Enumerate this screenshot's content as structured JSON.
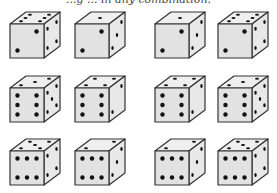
{
  "caption": "...g ... in any combination.",
  "colors": {
    "front_face": "#e2e2e2",
    "top_face": "#efefef",
    "right_face": "#e8e8e8",
    "outline": "#333333",
    "pip": "#111111"
  },
  "dice": [
    {
      "row": 1,
      "col": 1,
      "x": 8,
      "y": 10,
      "top": 6,
      "front": 2,
      "right": 4
    },
    {
      "row": 1,
      "col": 2,
      "x": 73,
      "y": 10,
      "top": 1,
      "front": 2,
      "right": 3
    },
    {
      "row": 1,
      "col": 3,
      "x": 153,
      "y": 10,
      "top": 1,
      "front": 2,
      "right": 3
    },
    {
      "row": 1,
      "col": 4,
      "x": 216,
      "y": 10,
      "top": 6,
      "front": 2,
      "right": 4
    },
    {
      "row": 2,
      "col": 1,
      "x": 8,
      "y": 74,
      "top": 3,
      "front": 6,
      "right": 5
    },
    {
      "row": 2,
      "col": 2,
      "x": 73,
      "y": 74,
      "top": 4,
      "front": 6,
      "right": 2
    },
    {
      "row": 2,
      "col": 3,
      "x": 153,
      "y": 74,
      "top": 4,
      "front": 6,
      "right": 2
    },
    {
      "row": 2,
      "col": 4,
      "x": 216,
      "y": 74,
      "top": 3,
      "front": 6,
      "right": 5
    },
    {
      "row": 3,
      "col": 1,
      "x": 8,
      "y": 137,
      "top": 5,
      "front": 6,
      "right": 4,
      "front_orientation": "horizontal"
    },
    {
      "row": 3,
      "col": 2,
      "x": 73,
      "y": 137,
      "top": 2,
      "front": 6,
      "right": 3,
      "front_orientation": "horizontal"
    },
    {
      "row": 3,
      "col": 3,
      "x": 153,
      "y": 137,
      "top": 2,
      "front": 6,
      "right": 3,
      "front_orientation": "horizontal"
    },
    {
      "row": 3,
      "col": 4,
      "x": 216,
      "y": 137,
      "top": 5,
      "front": 6,
      "right": 4,
      "front_orientation": "horizontal"
    }
  ]
}
